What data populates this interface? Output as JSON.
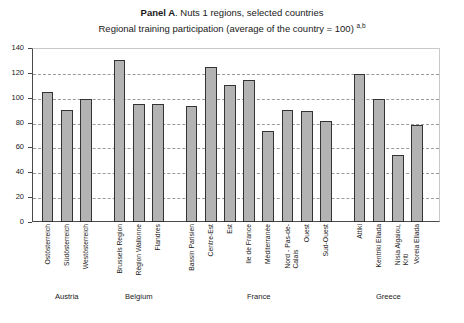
{
  "titles": {
    "panel_prefix": "Panel A",
    "panel_rest": ". Nuts 1 regions, selected countries",
    "subtitle": "Regional training participation (average of the country = 100)",
    "subtitle_footnote": "a,b"
  },
  "chart_data": {
    "type": "bar",
    "title": "Panel A. Nuts 1 regions, selected countries",
    "subtitle": "Regional training participation (average of the country = 100) a,b",
    "xlabel": "",
    "ylabel": "",
    "ylim": [
      0,
      140
    ],
    "yticks": [
      0,
      20,
      40,
      60,
      80,
      100,
      120,
      140
    ],
    "grid": true,
    "legend": "none",
    "categories": [
      "Ostösterreich",
      "Südösterreich",
      "Westösterreich",
      "Brussels Region",
      "Région Wallonne",
      "Flandres",
      "Bassin Parisien",
      "Centre-Est",
      "Est",
      "Ile de France",
      "Méditerranée",
      "Nord - Pas-de-\nCalais",
      "Ouest",
      "Sud-Ouest",
      "Attiki",
      "Kentriki Ellada",
      "Nisia Aigaiou,\nKriti",
      "Voreia Ellada"
    ],
    "values": [
      105,
      90,
      99,
      130,
      95,
      95,
      93,
      125,
      110,
      114,
      73,
      90,
      89,
      81,
      119,
      99,
      54,
      78
    ],
    "groups": [
      {
        "label": "Austria",
        "start": 0,
        "end": 2
      },
      {
        "label": "Belgium",
        "start": 3,
        "end": 5
      },
      {
        "label": "France",
        "start": 6,
        "end": 13
      },
      {
        "label": "Greece",
        "start": 14,
        "end": 17
      }
    ],
    "colors": {
      "bar_fill": "#b3b3b3",
      "bar_border": "#333333",
      "axis": "#4a4a4a",
      "gridline": "#9a9a9a",
      "text": "#1a1a1a"
    }
  }
}
